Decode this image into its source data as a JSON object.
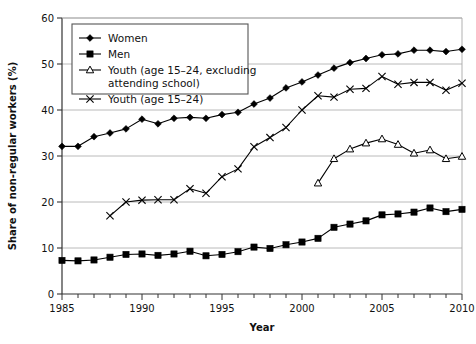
{
  "chart_data": {
    "type": "line",
    "title": "",
    "xlabel": "Year",
    "ylabel": "Share of non-regular workers (%)",
    "xlim": [
      1985,
      2010
    ],
    "ylim": [
      0,
      60
    ],
    "xticks": [
      1985,
      1990,
      1995,
      2000,
      2005,
      2010
    ],
    "xtick_labels": [
      "1985",
      "1990",
      "1995",
      "2000",
      "2005",
      "2010"
    ],
    "yticks": [
      0,
      10,
      20,
      30,
      40,
      50,
      60
    ],
    "ytick_labels": [
      "0",
      "10",
      "20",
      "30",
      "40",
      "50",
      "60"
    ],
    "minor_xtick_interval": 1,
    "grid": "horizontal",
    "legend_position": "upper-left",
    "series": [
      {
        "name": "Women",
        "marker": "diamond",
        "color": "#000000",
        "x": [
          1985,
          1986,
          1987,
          1988,
          1989,
          1990,
          1991,
          1992,
          1993,
          1994,
          1995,
          1996,
          1997,
          1998,
          1999,
          2000,
          2001,
          2002,
          2003,
          2004,
          2005,
          2006,
          2007,
          2008,
          2009,
          2010
        ],
        "values": [
          32.1,
          32.1,
          34.2,
          35.0,
          35.9,
          38.0,
          37.0,
          38.2,
          38.4,
          38.2,
          39.0,
          39.5,
          41.3,
          42.6,
          44.8,
          46.1,
          47.6,
          49.1,
          50.3,
          51.2,
          52.0,
          52.2,
          53.0,
          53.0,
          52.7,
          53.2
        ]
      },
      {
        "name": "Men",
        "marker": "square",
        "color": "#000000",
        "x": [
          1985,
          1986,
          1987,
          1988,
          1989,
          1990,
          1991,
          1992,
          1993,
          1994,
          1995,
          1996,
          1997,
          1998,
          1999,
          2000,
          2001,
          2002,
          2003,
          2004,
          2005,
          2006,
          2007,
          2008,
          2009,
          2010
        ],
        "values": [
          7.3,
          7.2,
          7.4,
          8.0,
          8.6,
          8.7,
          8.4,
          8.7,
          9.3,
          8.3,
          8.6,
          9.2,
          10.2,
          9.9,
          10.7,
          11.3,
          12.1,
          14.5,
          15.2,
          15.9,
          17.2,
          17.4,
          17.8,
          18.7,
          17.9,
          18.4
        ]
      },
      {
        "name": "Youth (age 15–24, excluding attending school)",
        "marker": "triangle-open",
        "color": "#000000",
        "x": [
          2001,
          2002,
          2003,
          2004,
          2005,
          2006,
          2007,
          2008,
          2009,
          2010
        ],
        "values": [
          24.1,
          29.4,
          31.5,
          32.8,
          33.7,
          32.5,
          30.6,
          31.3,
          29.4,
          29.9
        ]
      },
      {
        "name": "Youth (age 15–24)",
        "marker": "x",
        "color": "#000000",
        "x": [
          1988,
          1989,
          1990,
          1991,
          1992,
          1993,
          1994,
          1995,
          1996,
          1997,
          1998,
          1999,
          2000,
          2001,
          2002,
          2003,
          2004,
          2005,
          2006,
          2007,
          2008,
          2009,
          2010
        ],
        "values": [
          17.0,
          20.0,
          20.4,
          20.5,
          20.5,
          22.9,
          21.9,
          25.5,
          27.2,
          32.0,
          34.0,
          36.2,
          40.0,
          43.1,
          42.8,
          44.5,
          44.7,
          47.3,
          45.6,
          46.0,
          46.0,
          44.3,
          45.8
        ]
      }
    ],
    "legend_entries": [
      {
        "label": "Women",
        "marker": "diamond",
        "line_break": false
      },
      {
        "label": "Men",
        "marker": "square",
        "line_break": false
      },
      {
        "label": "Youth (age 15–24, excluding",
        "label2": "attending school)",
        "marker": "triangle-open",
        "line_break": true
      },
      {
        "label": "Youth (age 15–24)",
        "marker": "x",
        "line_break": false
      }
    ]
  }
}
